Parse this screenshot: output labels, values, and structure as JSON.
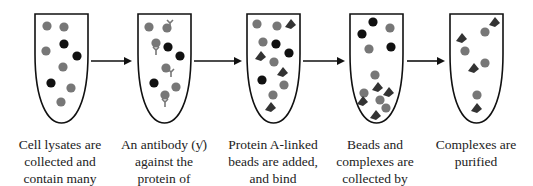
{
  "colors": {
    "gray_dot": "#777777",
    "black_dot": "#111111",
    "outline": "#111111",
    "arrow": "#111111"
  },
  "steps": [
    {
      "caption": [
        "Cell lysates are",
        "collected and",
        "contain many"
      ],
      "tube_x": 35,
      "dots": [
        [
          47,
          26,
          "g"
        ],
        [
          64,
          27,
          "g"
        ],
        [
          64,
          44,
          "b"
        ],
        [
          46,
          51,
          "g"
        ],
        [
          77,
          56,
          "b"
        ],
        [
          63,
          67,
          "g"
        ],
        [
          51,
          83,
          "b"
        ],
        [
          71,
          88,
          "g"
        ],
        [
          61,
          102,
          "g"
        ]
      ],
      "antibodies": [],
      "beads": []
    },
    {
      "caption": [
        "An antibody (ƴ) against the",
        "against the",
        "protein of"
      ],
      "tube_x": 138,
      "dots": [
        [
          149,
          27,
          "g"
        ],
        [
          167,
          28,
          "g"
        ],
        [
          156,
          43,
          "g"
        ],
        [
          168,
          47,
          "b"
        ],
        [
          180,
          56,
          "b"
        ],
        [
          166,
          68,
          "g"
        ],
        [
          154,
          83,
          "b"
        ],
        [
          176,
          87,
          "g"
        ],
        [
          165,
          95,
          "g"
        ]
      ],
      "antibodies": [
        [
          170,
          23
        ],
        [
          156,
          50
        ],
        [
          171,
          72
        ],
        [
          165,
          102
        ]
      ],
      "beads": []
    },
    {
      "caption": [
        "Protein A-linked",
        "beads are added,",
        "and bind"
      ],
      "tube_x": 247,
      "dots": [
        [
          257,
          24,
          "g"
        ],
        [
          277,
          26,
          "g"
        ],
        [
          263,
          42,
          "g"
        ],
        [
          276,
          44,
          "b"
        ],
        [
          289,
          53,
          "b"
        ],
        [
          274,
          62,
          "g"
        ],
        [
          262,
          80,
          "b"
        ],
        [
          284,
          85,
          "g"
        ],
        [
          273,
          95,
          "g"
        ]
      ],
      "antibodies": [],
      "beads": [
        [
          290,
          24
        ],
        [
          260,
          56
        ],
        [
          282,
          72
        ],
        [
          270,
          107
        ]
      ]
    },
    {
      "caption": [
        "Beads and",
        "complexes are",
        "collected by"
      ],
      "tube_x": 350,
      "dots": [
        [
          373,
          22,
          "b"
        ],
        [
          390,
          28,
          "g"
        ],
        [
          362,
          34,
          "b"
        ],
        [
          369,
          49,
          "g"
        ],
        [
          391,
          47,
          "b"
        ],
        [
          375,
          75,
          "g"
        ],
        [
          364,
          93,
          "g"
        ],
        [
          380,
          100,
          "g"
        ],
        [
          386,
          108,
          "g"
        ]
      ],
      "antibodies": [],
      "beads": [
        [
          377,
          87
        ],
        [
          362,
          101
        ],
        [
          375,
          115
        ],
        [
          388,
          92
        ]
      ]
    },
    {
      "caption": [
        "Complexes are",
        "purified"
      ],
      "tube_x": 450,
      "dots": [
        [
          485,
          32,
          "g"
        ],
        [
          465,
          51,
          "g"
        ],
        [
          485,
          63,
          "g"
        ],
        [
          477,
          95,
          "g"
        ]
      ],
      "antibodies": [],
      "beads": [
        [
          494,
          22
        ],
        [
          461,
          38
        ],
        [
          473,
          68
        ],
        [
          476,
          108
        ]
      ]
    }
  ],
  "arrows": [
    [
      91,
      132
    ],
    [
      194,
      242
    ],
    [
      303,
      345
    ],
    [
      407,
      445
    ]
  ]
}
